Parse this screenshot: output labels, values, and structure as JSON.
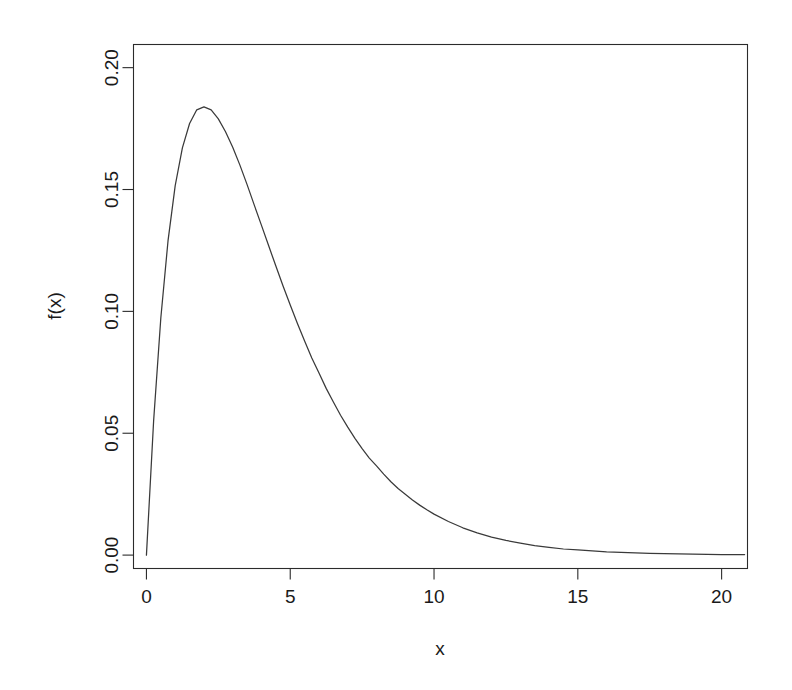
{
  "chart_data": {
    "type": "line",
    "title": "",
    "subtitle": "",
    "xlabel": "x",
    "ylabel": "f(x)",
    "xlim": [
      -0.45,
      20.9
    ],
    "ylim": [
      -0.0055,
      0.2095
    ],
    "grid": false,
    "legend": null,
    "annotations": [],
    "xticks": [
      0,
      5,
      10,
      15,
      20
    ],
    "xticklabels": [
      "0",
      "5",
      "10",
      "15",
      "20"
    ],
    "yticks": [
      0.0,
      0.05,
      0.1,
      0.15,
      0.2
    ],
    "yticklabels": [
      "0.00",
      "0.05",
      "0.10",
      "0.15",
      "0.20"
    ],
    "series": [
      {
        "name": "f(x)",
        "color": "#3a3a3a",
        "x": [
          0,
          0.25,
          0.5,
          0.75,
          1,
          1.25,
          1.5,
          1.75,
          2,
          2.25,
          2.5,
          2.75,
          3,
          3.25,
          3.5,
          3.75,
          4,
          4.25,
          4.5,
          4.75,
          5,
          5.25,
          5.5,
          5.75,
          6,
          6.25,
          6.5,
          6.75,
          7,
          7.25,
          7.5,
          7.75,
          8,
          8.25,
          8.5,
          8.75,
          9,
          9.25,
          9.5,
          9.75,
          10,
          10.5,
          11,
          11.5,
          12,
          12.5,
          13,
          13.5,
          14,
          14.5,
          15,
          15.5,
          16,
          16.5,
          17,
          17.5,
          18,
          18.5,
          19,
          19.5,
          20,
          20.8
        ],
        "y": [
          0,
          0.0551,
          0.0973,
          0.1289,
          0.1516,
          0.1671,
          0.1771,
          0.1827,
          0.1839,
          0.1827,
          0.179,
          0.1737,
          0.1673,
          0.16,
          0.152,
          0.1436,
          0.1353,
          0.1269,
          0.1186,
          0.1104,
          0.1026,
          0.095,
          0.0878,
          0.0809,
          0.0747,
          0.0684,
          0.0628,
          0.0574,
          0.0525,
          0.0479,
          0.0437,
          0.0398,
          0.0366,
          0.0332,
          0.0301,
          0.0273,
          0.025,
          0.0226,
          0.0205,
          0.0186,
          0.0168,
          0.0138,
          0.0112,
          0.0091,
          0.0074,
          0.006,
          0.0049,
          0.0039,
          0.0032,
          0.0025,
          0.0021,
          0.0017,
          0.0013,
          0.0011,
          0.0009,
          0.0007,
          0.0006,
          0.0005,
          0.0004,
          0.0003,
          0.0002,
          0.0002
        ]
      }
    ]
  },
  "axes": {
    "x_title": "x",
    "y_title": "f(x)"
  },
  "colors": {
    "background": "#ffffff",
    "axis": "#2b2b2b",
    "curve": "#3a3a3a",
    "text": "#1a1a1a"
  }
}
